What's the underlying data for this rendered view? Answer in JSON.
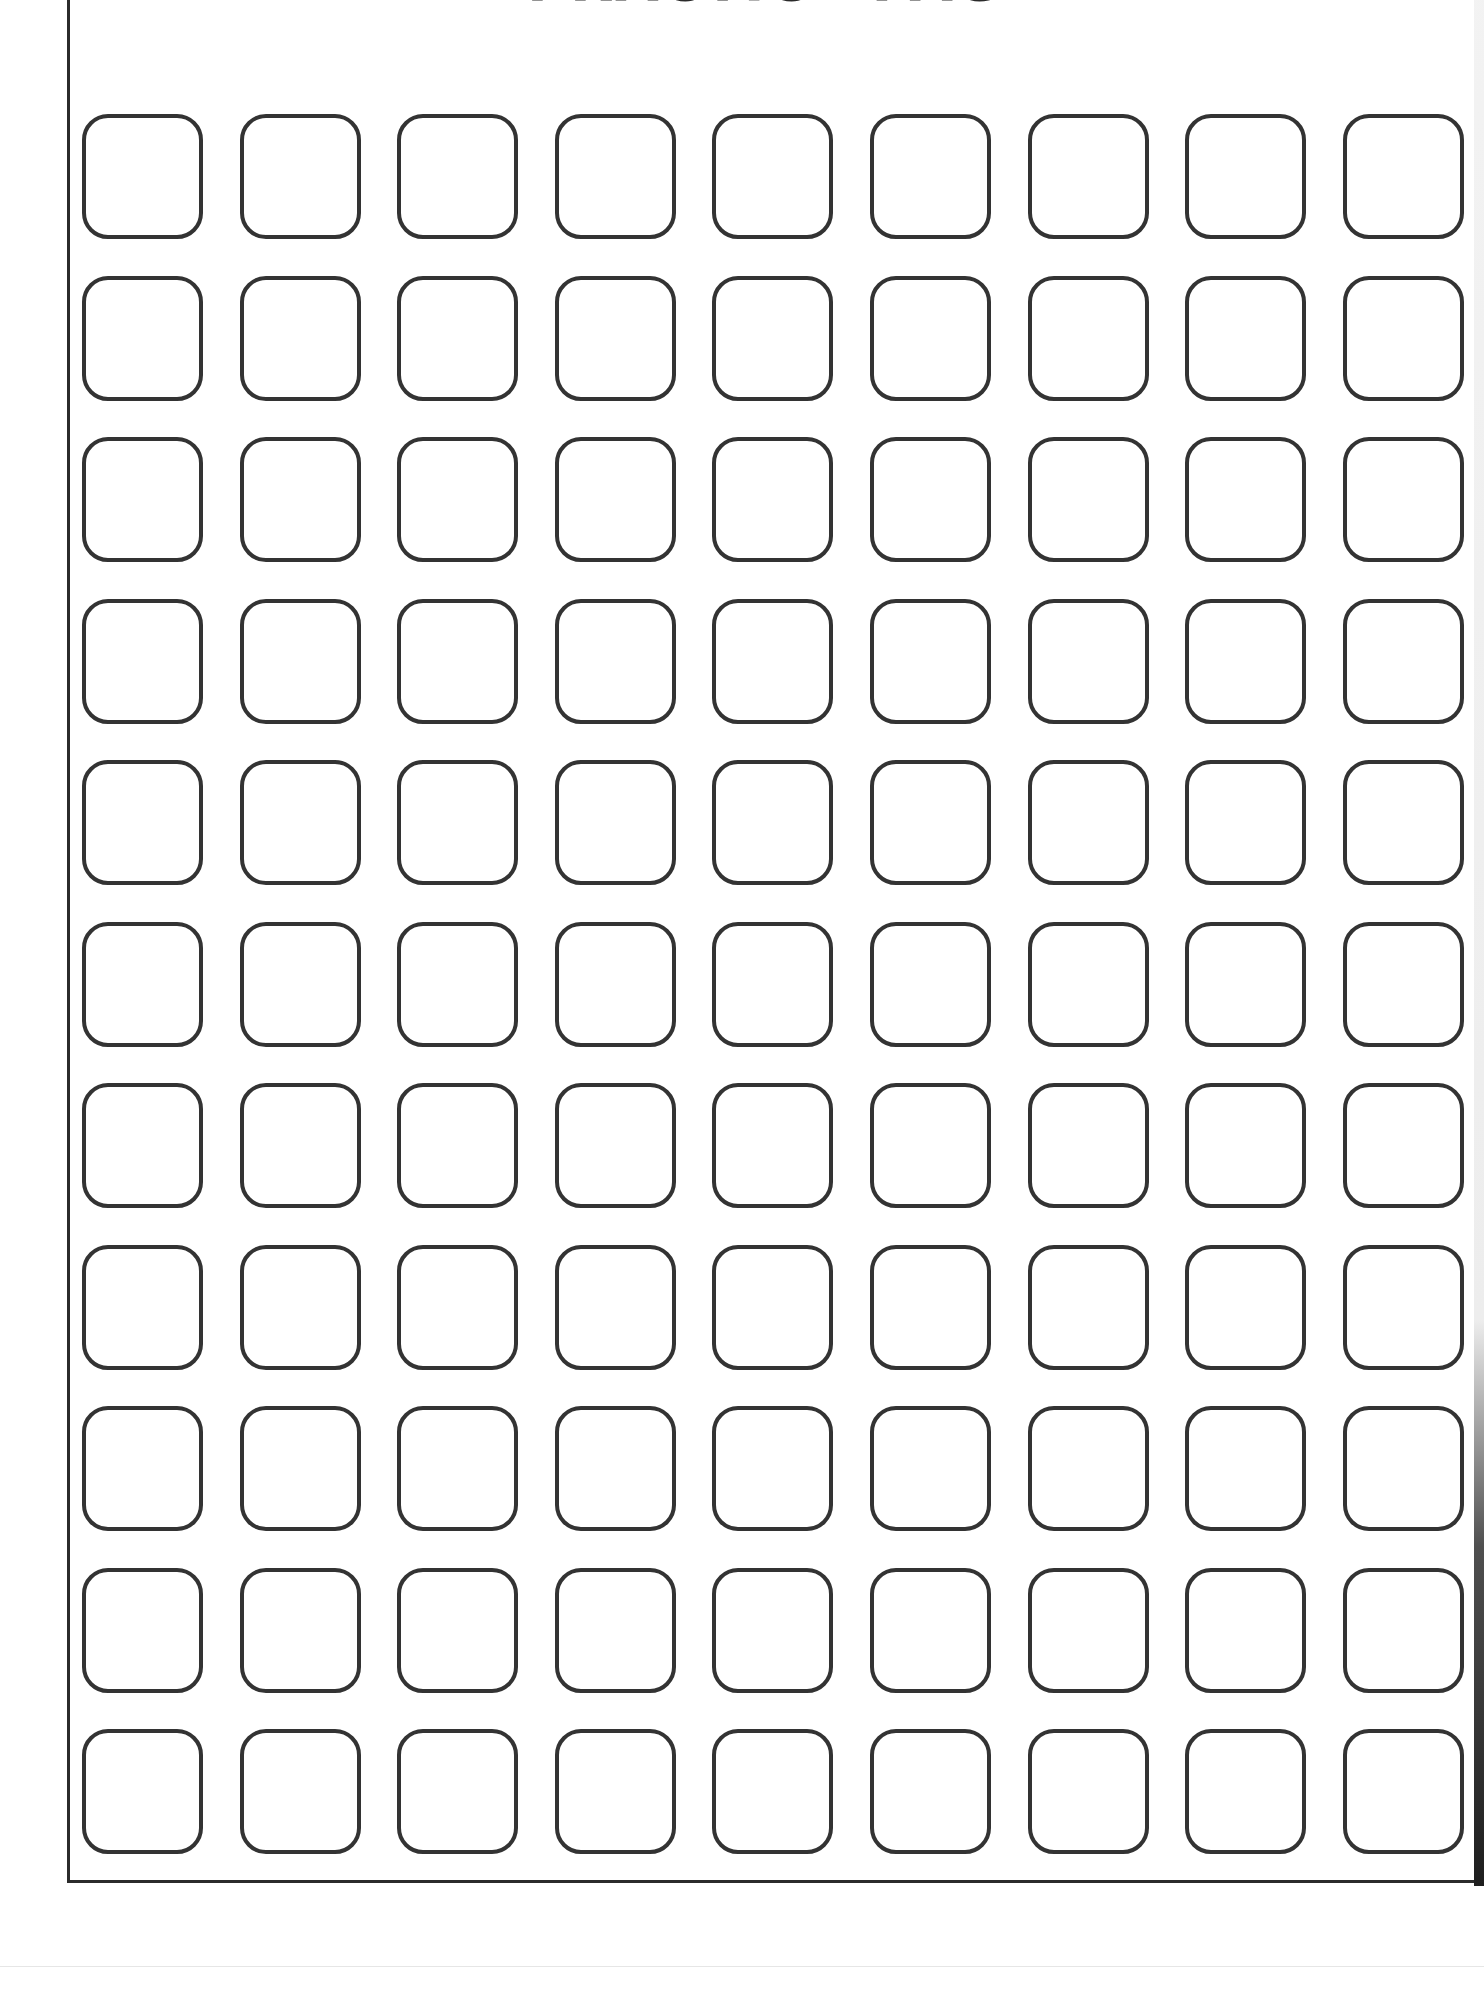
{
  "page": {
    "title": "PRACTICE PAGE",
    "title_note": "cropped at top edge; only bottoms of letters visible"
  },
  "grid": {
    "rows": 11,
    "columns": 9,
    "total_boxes": 99,
    "box_shape": "rounded-square",
    "box_content": "empty",
    "stroke_color": "#333333"
  }
}
